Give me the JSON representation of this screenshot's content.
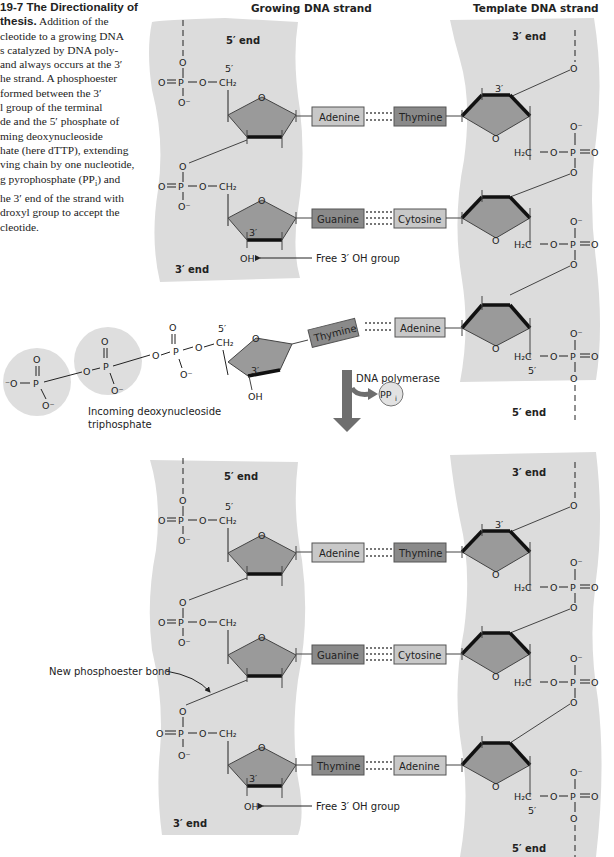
{
  "caption": {
    "title": "19-7 The Directionality of",
    "title_cont": "thesis.",
    "lines": [
      "Addition of the",
      "cleotide to a growing DNA",
      "s catalyzed by DNA poly-",
      "and always occurs at the 3′",
      "he strand. A phosphoester",
      "formed between the 3′",
      "l group of the terminal",
      "de and the 5′ phosphate of",
      "ming deoxynucleoside",
      "hate (here dTTP), extending",
      "ving chain by one nucleotide,",
      "g pyrophosphate (PP",
      "he 3′ end of the strand with",
      "droxyl group to accept the",
      "cleotide."
    ],
    "line_pp_suffix": ") and",
    "pp_sub": "i"
  },
  "headers": {
    "growing": "Growing DNA strand",
    "template": "Template DNA strand"
  },
  "labels": {
    "five_end": "5′ end",
    "three_end": "3′ end",
    "five_prime": "5′",
    "three_prime": "3′",
    "free_oh": "Free 3′ OH group",
    "incoming": "Incoming deoxynucleoside",
    "incoming2": "triphosphate",
    "polymerase": "DNA polymerase",
    "ppi": "PP",
    "ppi_sub": "i",
    "new_bond": "New phosphoester bond",
    "oh": "OH",
    "o": "O",
    "o_minus": "O⁻",
    "p": "P",
    "ch2": "CH₂",
    "h2c": "H₂C"
  },
  "top_pairs": [
    {
      "left": "Adenine",
      "right": "Thymine"
    },
    {
      "left": "Guanine",
      "right": "Cytosine"
    }
  ],
  "incoming_pair": {
    "left": "Thymine",
    "right": "Adenine"
  },
  "bottom_pairs": [
    {
      "left": "Adenine",
      "right": "Thymine"
    },
    {
      "left": "Guanine",
      "right": "Cytosine"
    },
    {
      "left": "Thymine",
      "right": "Adenine"
    }
  ],
  "colors": {
    "panel": "#dcdcdc",
    "sugar": "#9a9a9a",
    "purine_box": "#8c8c8c",
    "pyrimidine_box": "#c4c4c4",
    "dark_box": "#8a8a8a",
    "light_box": "#c8c8c8",
    "arrow": "#6e6e6e"
  }
}
